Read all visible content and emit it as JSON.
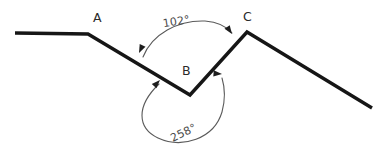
{
  "diagram": {
    "type": "angle-geometry-figure",
    "background_color": "#ffffff",
    "line_color": "#161616",
    "arc_color": "#5a5a5a",
    "label_color": "#2a2a2a",
    "vertices": [
      {
        "name": "A",
        "label": "A",
        "x": 88,
        "y": 34,
        "label_x": 93,
        "label_y": 22
      },
      {
        "name": "B",
        "label": "B",
        "x": 190,
        "y": 95,
        "label_x": 182,
        "label_y": 75
      },
      {
        "name": "C",
        "label": "C",
        "x": 247,
        "y": 32,
        "label_x": 243,
        "label_y": 21
      }
    ],
    "polyline_points": "15,33 88,34 190,95 247,32 372,108",
    "segments": [
      {
        "name": "ray-start-to-A",
        "from_x": 15,
        "from_y": 33,
        "to_x": 88,
        "to_y": 34
      },
      {
        "name": "segment-A-to-B",
        "from_x": 88,
        "from_y": 34,
        "to_x": 190,
        "to_y": 95
      },
      {
        "name": "segment-B-to-C",
        "from_x": 190,
        "from_y": 95,
        "to_x": 247,
        "to_y": 32
      },
      {
        "name": "ray-C-to-end",
        "from_x": 247,
        "from_y": 32,
        "to_x": 372,
        "to_y": 108
      }
    ],
    "angles": [
      {
        "name": "interior-angle-at-B",
        "label": "102°",
        "value": 102,
        "unit": "degrees",
        "label_x": 177,
        "label_y": 25,
        "label_rotation": -9,
        "arc_path": "M 143,57 C 152,34 178,20 205,21 C 218,22 227,27 232,33",
        "arrow_start": {
          "x": 139,
          "y": 53,
          "rotation": 115
        },
        "arrow_end": {
          "x": 232,
          "y": 34,
          "rotation": 55
        }
      },
      {
        "name": "reflex-angle-at-B",
        "label": "258°",
        "value": 258,
        "unit": "degrees",
        "label_x": 185,
        "label_y": 136,
        "label_rotation": -26,
        "arc_path": "M 159,84 C 136,106 137,128 158,138 C 182,149 214,139 222,112 C 225,101 225,88 222,78",
        "arrow_start": {
          "x": 160,
          "y": 80,
          "rotation": -46
        },
        "arrow_end": {
          "x": 222,
          "y": 74,
          "rotation": 4
        }
      }
    ]
  }
}
